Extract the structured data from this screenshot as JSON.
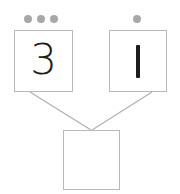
{
  "widget": {
    "title": "Number bond addition diagram",
    "colors": {
      "dot": "#a8a8a8",
      "box_border": "#b9b9b9",
      "connector_line": "#b0b0b0",
      "glyph": "#1d1d1d",
      "background": "#ffffff"
    }
  },
  "left_group": {
    "dot_count": 3,
    "dots": [
      "dot",
      "dot",
      "dot"
    ],
    "box_value": "3"
  },
  "right_group": {
    "dot_count": 1,
    "dots": [
      "dot"
    ],
    "box_value": "1"
  },
  "sum_box": {
    "value": "",
    "placeholder": ""
  },
  "connectors": [
    {
      "name": "left-to-sum",
      "from": "left-box-bottom",
      "to": "sum-box-top"
    },
    {
      "name": "right-to-sum",
      "from": "right-box-bottom",
      "to": "sum-box-top"
    }
  ]
}
